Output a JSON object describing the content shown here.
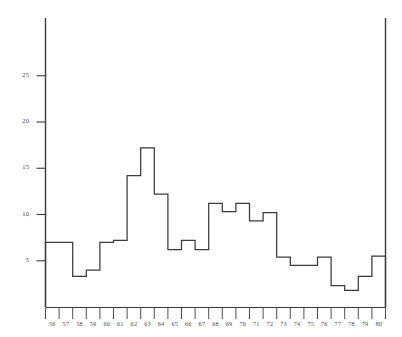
{
  "chart_data": {
    "type": "bar",
    "title": "",
    "subtitle": "",
    "xlabel": "",
    "ylabel": "",
    "categories": [
      "56",
      "57",
      "58",
      "59",
      "60",
      "61",
      "62",
      "63",
      "64",
      "65",
      "66",
      "67",
      "68",
      "69",
      "70",
      "71",
      "72",
      "73",
      "74",
      "75",
      "76",
      "77",
      "78",
      "79",
      "80"
    ],
    "values": [
      7.0,
      7.0,
      3.3,
      4.0,
      7.0,
      7.2,
      14.2,
      17.2,
      12.2,
      6.2,
      7.2,
      6.2,
      11.2,
      10.3,
      11.2,
      9.3,
      10.2,
      5.4,
      4.5,
      4.5,
      5.4,
      2.3,
      1.8,
      3.3,
      5.5
    ],
    "style": "step-outline",
    "xlim": [
      56,
      81
    ],
    "ylim": [
      0,
      28
    ],
    "yticks": [
      5,
      10,
      15,
      20,
      25
    ],
    "ytick_labels": [
      "5",
      "10",
      "15",
      "20",
      "25"
    ],
    "xtick_labels": [
      "56",
      "57",
      "58",
      "59",
      "60",
      "61",
      "62",
      "63",
      "64",
      "65",
      "66",
      "67",
      "68",
      "69",
      "70",
      "71",
      "72",
      "73",
      "74",
      "75",
      "76",
      "77",
      "78",
      "79",
      "80"
    ],
    "grid": false,
    "legend": null,
    "annotations": [],
    "line_color": "#3a3a3a",
    "axis_color": "#3a3a3a",
    "background_color": "#ffffff"
  },
  "axes": {
    "y_axis_name": "y-axis",
    "x_axis_name": "x-axis"
  }
}
